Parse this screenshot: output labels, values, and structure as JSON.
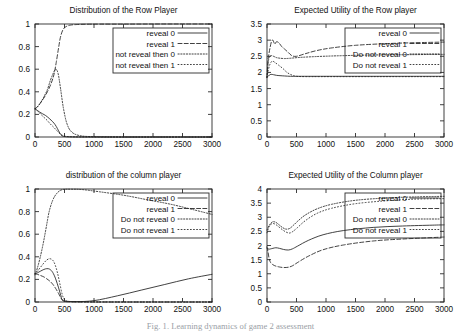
{
  "figure": {
    "caption": "Fig. 1. Learning dynamics of game 2 assessment"
  },
  "chart_data": [
    {
      "id": "row-distribution",
      "type": "line",
      "title": "Distribution of the Row Player",
      "xlabel": "",
      "ylabel": "",
      "xlim": [
        0,
        3000
      ],
      "ylim": [
        0,
        1
      ],
      "xticks": [
        0,
        500,
        1000,
        1500,
        2000,
        2500,
        3000
      ],
      "yticks": [
        0,
        0.2,
        0.4,
        0.6,
        0.8,
        1
      ],
      "grid": false,
      "legend_position": "top-right",
      "series": [
        {
          "name": "reveal 0",
          "dash": "solid",
          "x": [
            0,
            40,
            80,
            130,
            180,
            240,
            300,
            340,
            380,
            420,
            460,
            520,
            600,
            800,
            1200,
            1800,
            2400,
            3000
          ],
          "y": [
            0.25,
            0.235,
            0.22,
            0.205,
            0.19,
            0.165,
            0.135,
            0.11,
            0.075,
            0.035,
            0.01,
            0.003,
            0.001,
            0,
            0,
            0,
            0,
            0
          ]
        },
        {
          "name": "reveal 1",
          "dash": "dashed",
          "x": [
            0,
            40,
            90,
            150,
            210,
            270,
            320,
            360,
            400,
            430,
            470,
            520,
            600,
            700,
            850,
            1100,
            1500,
            2100,
            3000
          ],
          "y": [
            0.25,
            0.265,
            0.3,
            0.345,
            0.4,
            0.47,
            0.55,
            0.66,
            0.79,
            0.88,
            0.945,
            0.975,
            0.99,
            0.995,
            0.998,
            0.999,
            0.999,
            1.0,
            1.0
          ]
        },
        {
          "name": "not reveal then 0",
          "dash": "dotted",
          "x": [
            0,
            40,
            90,
            150,
            210,
            260,
            310,
            350,
            390,
            430,
            480,
            540,
            620,
            760,
            1000,
            1500,
            2200,
            3000
          ],
          "y": [
            0.25,
            0.268,
            0.3,
            0.355,
            0.42,
            0.5,
            0.565,
            0.6,
            0.565,
            0.44,
            0.26,
            0.12,
            0.045,
            0.012,
            0.003,
            0,
            0,
            0
          ]
        },
        {
          "name": "not reveal then 1",
          "dash": "fine-dotted",
          "x": [
            0,
            40,
            90,
            150,
            210,
            260,
            310,
            350,
            390,
            430,
            480,
            540,
            620,
            760,
            1000,
            1500,
            2200,
            3000
          ],
          "y": [
            0.25,
            0.232,
            0.205,
            0.175,
            0.145,
            0.115,
            0.09,
            0.068,
            0.046,
            0.025,
            0.012,
            0.005,
            0.002,
            0.001,
            0,
            0,
            0,
            0
          ]
        }
      ]
    },
    {
      "id": "row-utility",
      "type": "line",
      "title": "Expected Utility of the Row player",
      "xlabel": "",
      "ylabel": "",
      "xlim": [
        0,
        3000
      ],
      "ylim": [
        0,
        3.5
      ],
      "xticks": [
        0,
        500,
        1000,
        1500,
        2000,
        2500,
        3000
      ],
      "yticks": [
        0,
        0.5,
        1,
        1.5,
        2,
        2.5,
        3,
        3.5
      ],
      "grid": false,
      "legend_position": "top-right",
      "series": [
        {
          "name": "reveal 0",
          "dash": "solid",
          "x": [
            0,
            20,
            40,
            70,
            110,
            160,
            220,
            300,
            400,
            500,
            700,
            1000,
            1500,
            2000,
            2500,
            3000
          ],
          "y": [
            1.85,
            1.88,
            1.92,
            1.94,
            1.93,
            1.91,
            1.9,
            1.89,
            1.88,
            1.88,
            1.88,
            1.88,
            1.88,
            1.88,
            1.88,
            1.88
          ]
        },
        {
          "name": "reveal 1",
          "dash": "dashed",
          "x": [
            0,
            15,
            30,
            50,
            75,
            100,
            130,
            160,
            200,
            250,
            300,
            360,
            420,
            500,
            650,
            850,
            1100,
            1500,
            2000,
            2500,
            3000
          ],
          "y": [
            1.85,
            2.35,
            2.55,
            2.75,
            2.95,
            3.0,
            2.88,
            2.95,
            2.92,
            2.8,
            2.72,
            2.62,
            2.52,
            2.5,
            2.58,
            2.68,
            2.76,
            2.84,
            2.89,
            2.92,
            2.94
          ]
        },
        {
          "name": "Do not reveal 0",
          "dash": "dotted",
          "x": [
            0,
            20,
            40,
            70,
            110,
            160,
            220,
            300,
            400,
            520,
            700,
            950,
            1300,
            1800,
            2400,
            3000
          ],
          "y": [
            1.85,
            2.3,
            2.48,
            2.52,
            2.5,
            2.46,
            2.44,
            2.43,
            2.44,
            2.46,
            2.48,
            2.5,
            2.52,
            2.54,
            2.55,
            2.56
          ]
        },
        {
          "name": "Do not reveal 1",
          "dash": "fine-dotted",
          "x": [
            0,
            20,
            50,
            90,
            140,
            200,
            270,
            340,
            420,
            500,
            650,
            900,
            1300,
            1900,
            2500,
            3000
          ],
          "y": [
            1.85,
            2.05,
            2.25,
            2.35,
            2.3,
            2.22,
            2.12,
            2.0,
            1.92,
            1.88,
            1.87,
            1.87,
            1.87,
            1.87,
            1.87,
            1.87
          ]
        }
      ]
    },
    {
      "id": "column-distribution",
      "type": "line",
      "title": "distribution of the column player",
      "xlabel": "",
      "ylabel": "",
      "xlim": [
        0,
        3000
      ],
      "ylim": [
        0,
        1
      ],
      "xticks": [
        0,
        500,
        1000,
        1500,
        2000,
        2500,
        3000
      ],
      "yticks": [
        0,
        0.2,
        0.4,
        0.6,
        0.8,
        1
      ],
      "grid": false,
      "legend_position": "top-right",
      "series": [
        {
          "name": "reveal 0",
          "dash": "solid",
          "x": [
            0,
            40,
            90,
            150,
            200,
            250,
            300,
            350,
            400,
            440,
            480,
            700,
            1000,
            1400,
            1800,
            2200,
            2600,
            3000
          ],
          "y": [
            0.25,
            0.258,
            0.272,
            0.288,
            0.295,
            0.29,
            0.262,
            0.205,
            0.125,
            0.055,
            0.012,
            0.004,
            0.012,
            0.055,
            0.105,
            0.155,
            0.205,
            0.245
          ]
        },
        {
          "name": "reveal 1",
          "dash": "dashed",
          "x": [
            0,
            40,
            90,
            150,
            200,
            250,
            300,
            350,
            400,
            440,
            480,
            540,
            700,
            1000,
            1600,
            2200,
            3000
          ],
          "y": [
            0.25,
            0.245,
            0.235,
            0.222,
            0.205,
            0.185,
            0.158,
            0.12,
            0.075,
            0.035,
            0.01,
            0.003,
            0.001,
            0,
            0,
            0,
            0
          ]
        },
        {
          "name": "Do not reveal 0",
          "dash": "dotted",
          "x": [
            0,
            40,
            90,
            140,
            190,
            240,
            300,
            360,
            420,
            470,
            520,
            620,
            800,
            1100,
            1500,
            1900,
            2300,
            2700,
            3000
          ],
          "y": [
            0.24,
            0.3,
            0.4,
            0.52,
            0.66,
            0.8,
            0.9,
            0.955,
            0.985,
            0.995,
            0.998,
            0.998,
            0.995,
            0.975,
            0.945,
            0.905,
            0.865,
            0.815,
            0.775
          ]
        },
        {
          "name": "Do not reveal 1",
          "dash": "fine-dotted",
          "x": [
            0,
            40,
            90,
            150,
            200,
            250,
            300,
            340,
            380,
            420,
            460,
            500,
            560,
            700,
            1000,
            1500,
            2200,
            3000
          ],
          "y": [
            0.25,
            0.272,
            0.305,
            0.345,
            0.372,
            0.383,
            0.37,
            0.33,
            0.26,
            0.165,
            0.07,
            0.02,
            0.006,
            0.002,
            0.001,
            0,
            0,
            0
          ]
        }
      ]
    },
    {
      "id": "column-utility",
      "type": "line",
      "title": "Expected Utility of the Column player",
      "xlabel": "",
      "ylabel": "",
      "xlim": [
        0,
        3000
      ],
      "ylim": [
        0,
        4
      ],
      "xticks": [
        0,
        500,
        1000,
        1500,
        2000,
        2500,
        3000
      ],
      "yticks": [
        0,
        0.5,
        1,
        1.5,
        2,
        2.5,
        3,
        3.5,
        4
      ],
      "grid": false,
      "legend_position": "top-right",
      "series": [
        {
          "name": "reveal 0",
          "dash": "solid",
          "x": [
            0,
            15,
            35,
            60,
            100,
            150,
            210,
            280,
            360,
            430,
            520,
            700,
            950,
            1300,
            1800,
            2300,
            2800,
            3000
          ],
          "y": [
            1.9,
            1.88,
            1.87,
            1.88,
            1.9,
            1.92,
            1.9,
            1.86,
            1.84,
            1.88,
            1.98,
            2.18,
            2.38,
            2.53,
            2.64,
            2.69,
            2.72,
            2.73
          ]
        },
        {
          "name": "reveal 1",
          "dash": "dashed",
          "x": [
            0,
            15,
            35,
            60,
            100,
            150,
            210,
            280,
            360,
            430,
            520,
            700,
            950,
            1300,
            1800,
            2300,
            2800,
            3000
          ],
          "y": [
            1.95,
            1.8,
            1.55,
            1.4,
            1.32,
            1.27,
            1.24,
            1.22,
            1.23,
            1.28,
            1.4,
            1.62,
            1.85,
            2.02,
            2.16,
            2.23,
            2.28,
            2.3
          ]
        },
        {
          "name": "Do not reveal 0",
          "dash": "dotted",
          "x": [
            0,
            15,
            35,
            60,
            100,
            150,
            200,
            260,
            320,
            380,
            440,
            520,
            650,
            850,
            1100,
            1500,
            2000,
            2500,
            3000
          ],
          "y": [
            2.55,
            2.62,
            2.7,
            2.78,
            2.84,
            2.82,
            2.74,
            2.64,
            2.58,
            2.6,
            2.7,
            2.86,
            3.08,
            3.3,
            3.46,
            3.6,
            3.68,
            3.72,
            3.74
          ]
        },
        {
          "name": "Do not reveal 1",
          "dash": "fine-dotted",
          "x": [
            0,
            15,
            35,
            60,
            100,
            150,
            200,
            260,
            320,
            380,
            440,
            520,
            650,
            850,
            1100,
            1500,
            2000,
            2500,
            3000
          ],
          "y": [
            2.45,
            2.55,
            2.66,
            2.74,
            2.78,
            2.74,
            2.66,
            2.56,
            2.48,
            2.44,
            2.5,
            2.64,
            2.88,
            3.14,
            3.32,
            3.48,
            3.58,
            3.64,
            3.66
          ]
        }
      ]
    }
  ]
}
